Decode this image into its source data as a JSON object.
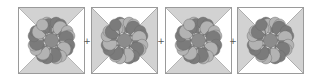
{
  "figure": {
    "colors": {
      "background": "#ffffff",
      "triangle_shaded": "#d2d2d2",
      "triangle_plain": "#ffffff",
      "outline": "#9a9a9a",
      "petal_light": "#b3b3b3",
      "petal_dark": "#7b7b7b",
      "center": "#8c8c8c"
    },
    "operator": "+",
    "tiles": [
      {
        "name": "tile-1",
        "shaded_triangles": [
          "top",
          "bottom"
        ]
      },
      {
        "name": "tile-2",
        "shaded_triangles": [
          "left",
          "right"
        ]
      },
      {
        "name": "tile-3",
        "shaded_triangles": [
          "top",
          "bottom"
        ]
      },
      {
        "name": "tile-4",
        "shaded_triangles": [
          "left",
          "right"
        ]
      }
    ]
  }
}
